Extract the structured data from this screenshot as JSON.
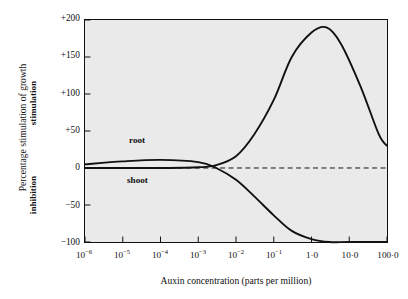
{
  "chart_data": {
    "type": "line",
    "title": "",
    "xlabel": "Auxin concentration (parts per million)",
    "ylabel": "Percentage stimulation of growth",
    "ylabel_upper": "stimulation",
    "ylabel_lower": "inhibition",
    "xscale": "log",
    "xlim": [
      1e-06,
      100
    ],
    "ylim": [
      -100,
      200
    ],
    "grid": false,
    "legend": "inline curve labels",
    "zero_reference_line": {
      "value": 0,
      "style": "dashed"
    },
    "xticks": [
      {
        "label": "10",
        "exponent": "-6",
        "value": 1e-06
      },
      {
        "label": "10",
        "exponent": "-5",
        "value": 1e-05
      },
      {
        "label": "10",
        "exponent": "-4",
        "value": 0.0001
      },
      {
        "label": "10",
        "exponent": "-3",
        "value": 0.001
      },
      {
        "label": "10",
        "exponent": "-2",
        "value": 0.01
      },
      {
        "label": "10",
        "exponent": "-1",
        "value": 0.1
      },
      {
        "label": "1·0",
        "exponent": "",
        "value": 1
      },
      {
        "label": "10·0",
        "exponent": "",
        "value": 10
      },
      {
        "label": "100·0",
        "exponent": "",
        "value": 100
      }
    ],
    "yticks": [
      {
        "label": "+200",
        "value": 200
      },
      {
        "label": "+150",
        "value": 150
      },
      {
        "label": "+100",
        "value": 100
      },
      {
        "label": "+50",
        "value": 50
      },
      {
        "label": "0",
        "value": 0
      },
      {
        "label": "−50",
        "value": -50
      },
      {
        "label": "−100",
        "value": -100
      }
    ],
    "series": [
      {
        "name": "root",
        "label": "root",
        "points": [
          [
            1e-06,
            5
          ],
          [
            1e-05,
            9
          ],
          [
            0.0001,
            11
          ],
          [
            0.001,
            8
          ],
          [
            0.003,
            0
          ],
          [
            0.01,
            -16
          ],
          [
            0.03,
            -38
          ],
          [
            0.1,
            -64
          ],
          [
            0.3,
            -85
          ],
          [
            1.0,
            -96
          ],
          [
            3.0,
            -100
          ],
          [
            10,
            -100
          ],
          [
            100,
            -100
          ]
        ]
      },
      {
        "name": "shoot",
        "label": "shoot",
        "points": [
          [
            1e-06,
            0
          ],
          [
            1e-05,
            0
          ],
          [
            0.0001,
            0
          ],
          [
            0.001,
            1
          ],
          [
            0.003,
            4
          ],
          [
            0.01,
            16
          ],
          [
            0.03,
            45
          ],
          [
            0.1,
            92
          ],
          [
            0.3,
            150
          ],
          [
            1.0,
            183
          ],
          [
            2.5,
            190
          ],
          [
            6.0,
            168
          ],
          [
            20,
            110
          ],
          [
            60,
            46
          ],
          [
            100,
            30
          ]
        ]
      }
    ]
  },
  "colors": {
    "plot_background": "#eaeaea",
    "page_background": "#ffffff",
    "axis": "#111111",
    "curve": "#111111"
  }
}
